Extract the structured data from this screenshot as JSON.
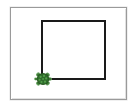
{
  "app": {
    "title": "Turtle Graphics",
    "window_name": "turtle-canvas-window"
  },
  "canvas": {
    "name": "turtle-drawing-canvas",
    "background_color": "#ffffff",
    "border_color": "#9a9a9a",
    "width_px": 117,
    "height_px": 93,
    "origin_x": 10,
    "origin_y": 7
  },
  "drawing": {
    "shape_name": "square",
    "pen_color": "#1a1a1a",
    "pen_width": 2,
    "fill": "none",
    "side_length_px": 62,
    "top_left": {
      "x": 42,
      "y": 21
    },
    "top_right": {
      "x": 105,
      "y": 21
    },
    "bottom_right": {
      "x": 105,
      "y": 79
    },
    "bottom_left": {
      "x": 42,
      "y": 79
    },
    "path_points": "42,79 42,21 105,21 105,79 42,79"
  },
  "turtle": {
    "name": "turtle-cursor",
    "position": {
      "x": 43,
      "y": 79
    },
    "heading_degrees": 0,
    "heading_label": "east",
    "shell_color": "#2f6b2c",
    "shell_highlight_color": "#54a04a",
    "limb_color": "#3d7a36",
    "visible": true
  }
}
